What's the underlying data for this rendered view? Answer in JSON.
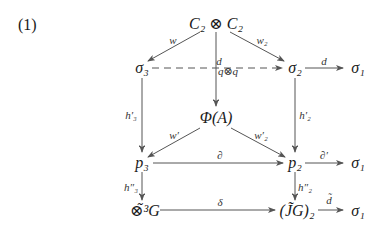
{
  "equation_number": "(1)",
  "nodes": {
    "top": "C₂ ⊗ C₂",
    "sigma3": "σ₃",
    "sigma2": "σ₂",
    "sigma1_row1": "σ₁",
    "phiA": "Φ(A)",
    "p3": "p₃",
    "p2": "p₂",
    "sigma1_row2": "σ₁",
    "tensor3G": "⊗̃³G",
    "JG2": "(J̃G)₂",
    "sigma1_row3": "σ₁"
  },
  "arrow_labels": {
    "w": "w",
    "w2": "w₂",
    "d_vertical": "d",
    "q_tensor_q": "q⊗q",
    "d_sigma2_sigma1": "d",
    "h3_prime": "h′₃",
    "h2_prime": "h′₂",
    "w_prime": "w′",
    "w2_prime": "w′₂",
    "partial": "∂",
    "partial_prime": "∂′",
    "h3_dprime": "h″₃",
    "h2_dprime": "h″₂",
    "delta": "δ",
    "d_tilde": "d̃"
  },
  "arrows": [
    {
      "from": "top",
      "to": "sigma3",
      "label": "w",
      "style": "solid"
    },
    {
      "from": "top",
      "to": "sigma2",
      "label": "w₂",
      "style": "solid"
    },
    {
      "from": "top",
      "to": "phiA",
      "label": "d",
      "style": "solid-double-head"
    },
    {
      "from": "sigma3",
      "to": "sigma2",
      "label": "q⊗q",
      "style": "dashed"
    },
    {
      "from": "sigma2",
      "to": "sigma1_row1",
      "label": "d",
      "style": "solid"
    },
    {
      "from": "sigma3",
      "to": "p3",
      "label": "h′₃",
      "style": "solid-double-head"
    },
    {
      "from": "sigma2",
      "to": "p2",
      "label": "h′₂",
      "style": "solid-double-head"
    },
    {
      "from": "phiA",
      "to": "p3",
      "label": "w′",
      "style": "solid"
    },
    {
      "from": "phiA",
      "to": "p2",
      "label": "w′₂",
      "style": "solid"
    },
    {
      "from": "p3",
      "to": "p2",
      "label": "∂",
      "style": "solid"
    },
    {
      "from": "p2",
      "to": "sigma1_row2",
      "label": "∂′",
      "style": "solid"
    },
    {
      "from": "p3",
      "to": "tensor3G",
      "label": "h″₃",
      "style": "solid-double-head"
    },
    {
      "from": "p2",
      "to": "JG2",
      "label": "h″₂",
      "style": "solid-double-head"
    },
    {
      "from": "tensor3G",
      "to": "JG2",
      "label": "δ",
      "style": "solid"
    },
    {
      "from": "JG2",
      "to": "sigma1_row3",
      "label": "d̃",
      "style": "solid"
    }
  ],
  "colors": {
    "line": "#555555",
    "text": "#1a1a1a",
    "background": "#ffffff"
  }
}
